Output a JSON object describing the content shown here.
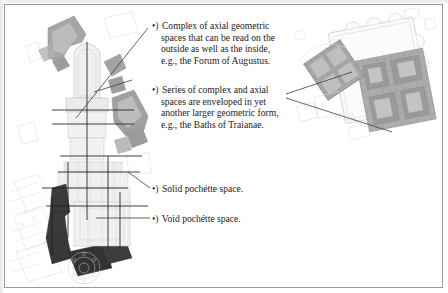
{
  "figure": {
    "kind": "annotated-architectural-plan",
    "background_color": "#ffffff",
    "frame_color": "#9a9a9a",
    "ink_color": "#24201e"
  },
  "callouts": [
    {
      "id": "callout-axial-geometric",
      "bullet": "•)",
      "text": "Complex of axial geometric spaces that can be read on the outside as well as the inside, e.g., the Forum of Augustus.",
      "leader": "diagonal-to-left-plan"
    },
    {
      "id": "callout-enveloped-spaces",
      "bullet": "•)",
      "text": "Series of complex and axial spaces are enveloped in yet another larger geometric form, e.g., the Baths of Traianae.",
      "leader": "fan-to-right-plan"
    },
    {
      "id": "callout-solid-pochette",
      "bullet": "•)",
      "text": "Solid pochétte space.",
      "leader": "diagonal-short"
    },
    {
      "id": "callout-void-pochette",
      "bullet": "•)",
      "text": "Void pochétte space.",
      "leader": "horizontal"
    }
  ],
  "drawings": {
    "left_plan": {
      "name": "roman-forum-imperial-fora-plan",
      "description": "Large vertical figure-ground plan of the Imperial Fora with solid pochéd masses and axial construction lines."
    },
    "right_plan": {
      "name": "baths-of-trajan-plan",
      "description": "Smaller plan of a bath complex enveloped within a larger rectangular precinct."
    }
  }
}
